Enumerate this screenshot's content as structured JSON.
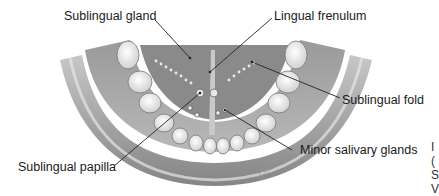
{
  "figure": {
    "labels": [
      {
        "id": "sublingual-gland",
        "text": "Sublingual gland"
      },
      {
        "id": "lingual-frenulum",
        "text": "Lingual frenulum"
      },
      {
        "id": "sublingual-fold",
        "text": "Sublingual fold"
      },
      {
        "id": "minor-salivary-glands",
        "text": "Minor salivary glands"
      },
      {
        "id": "sublingual-papilla",
        "text": "Sublingual papilla"
      }
    ],
    "cut_off_text": [
      "I",
      "(",
      "S",
      "V"
    ],
    "colors": {
      "ink": "#1a1a1a",
      "tissue_dark": "#7a7a7a",
      "tissue_mid": "#a8a8a8",
      "tissue_light": "#d4d4d4",
      "tooth": "#f4f4f4",
      "leader": "#222222"
    }
  }
}
